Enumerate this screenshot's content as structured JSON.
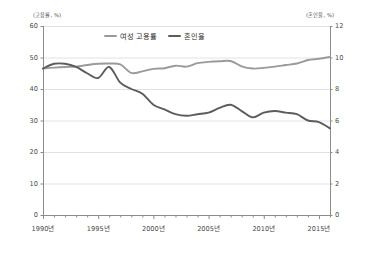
{
  "chart_data": {
    "type": "line",
    "title": "",
    "xlabel": "",
    "ylabel": "(고용률, %)",
    "y2label": "(혼인율, %)",
    "grid": true,
    "legend_position": "top-center",
    "x": [
      1990,
      1991,
      1992,
      1993,
      1994,
      1995,
      1996,
      1997,
      1998,
      1999,
      2000,
      2001,
      2002,
      2003,
      2004,
      2005,
      2006,
      2007,
      2008,
      2009,
      2010,
      2011,
      2012,
      2013,
      2014,
      2015,
      2016
    ],
    "xlim": [
      1990,
      2016
    ],
    "ylim": [
      0,
      60
    ],
    "y2lim": [
      0,
      12
    ],
    "yticks": [
      0,
      10,
      20,
      30,
      40,
      50,
      60
    ],
    "y2ticks": [
      0,
      2,
      4,
      6,
      8,
      10,
      12
    ],
    "xticks": [
      1990,
      1995,
      2000,
      2005,
      2010,
      2015
    ],
    "xticklabels": [
      "1990년",
      "1995년",
      "2000년",
      "2005년",
      "2010년",
      "2015년"
    ],
    "series": [
      {
        "name": "여성 고용률",
        "axis": "left",
        "unit": "%",
        "color": "#9a9a9a",
        "values": [
          46.5,
          46.8,
          47.0,
          47.1,
          47.6,
          48.0,
          48.1,
          47.8,
          45.1,
          45.6,
          46.4,
          46.6,
          47.4,
          47.1,
          48.2,
          48.6,
          48.8,
          48.9,
          47.2,
          46.5,
          46.7,
          47.1,
          47.6,
          48.1,
          49.2,
          49.6,
          50.2
        ],
        "display_values_pct": [
          46.5,
          46.8,
          47.0,
          47.1,
          47.6,
          48.0,
          48.1,
          47.8,
          45.1,
          45.6,
          46.4,
          46.6,
          47.4,
          47.1,
          48.2,
          48.6,
          48.8,
          48.9,
          47.2,
          46.5,
          46.7,
          47.1,
          47.6,
          48.1,
          49.2,
          49.6,
          50.2
        ]
      },
      {
        "name": "혼인율",
        "axis": "right",
        "unit": "%",
        "color": "#5c5c5c",
        "values": [
          9.3,
          9.6,
          9.6,
          9.4,
          9.0,
          8.7,
          9.4,
          8.4,
          8.0,
          7.7,
          7.0,
          6.7,
          6.4,
          6.3,
          6.4,
          6.5,
          6.8,
          7.0,
          6.6,
          6.2,
          6.5,
          6.6,
          6.5,
          6.4,
          6.0,
          5.9,
          5.5
        ]
      }
    ],
    "annotations": []
  },
  "axes": {
    "left_unit": "(고용률, %)",
    "right_unit": "(혼인율, %)"
  },
  "colors": {
    "series_employment": "#9a9a9a",
    "series_marriage": "#5c5c5c",
    "grid": "#e2e2e2",
    "axis": "#8c8c8c",
    "text": "#4a4a4a",
    "background": "#ffffff"
  }
}
